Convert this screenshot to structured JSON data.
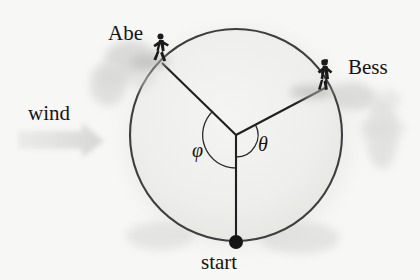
{
  "figure": {
    "type": "geometry-diagram",
    "background_color": "#f7f7f6",
    "ink_color": "#1a1a1a",
    "circle": {
      "center_x": 236,
      "center_y": 135,
      "radius": 106,
      "stroke_color": "#3a3a3a",
      "stroke_width": 2.1,
      "fill_color": "#f1f1ef"
    },
    "runners": [
      {
        "name": "Abe",
        "label": "Abe",
        "angle_deg": 136,
        "point_x": 162,
        "point_y": 63,
        "label_x": 108,
        "label_y": 23
      },
      {
        "name": "Bess",
        "label": "Bess",
        "angle_deg": 28,
        "point_x": 325,
        "point_y": 88,
        "label_x": 348,
        "label_y": 57
      }
    ],
    "start": {
      "label": "start",
      "point_x": 236,
      "point_y": 242,
      "dot_radius": 7,
      "dot_color": "#111111"
    },
    "angles": [
      {
        "symbol": "φ",
        "name": "phi",
        "arc_radius": 33,
        "from": "start-radius",
        "to": "Abe-radius",
        "label_x": 192,
        "label_y": 140
      },
      {
        "symbol": "θ",
        "name": "theta",
        "arc_radius": 22,
        "from": "start-radius",
        "to": "Bess-radius",
        "label_x": 258,
        "label_y": 134
      }
    ],
    "wind": {
      "label": "wind",
      "direction": "right",
      "arrow_color": "#e0e0de",
      "arrow_x": 18,
      "arrow_y": 140,
      "arrow_length": 84,
      "label_x": 28,
      "label_y": 103
    },
    "shadow_color": "#c9c9c7"
  }
}
